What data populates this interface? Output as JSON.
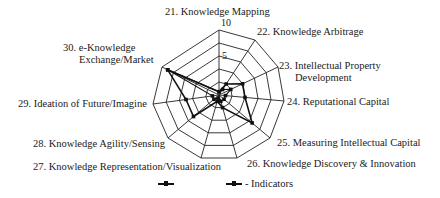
{
  "chart_data": {
    "type": "radar",
    "title": "",
    "axis_range": [
      0,
      10
    ],
    "tick_labels": [
      "5",
      "10"
    ],
    "grid_rings": [
      2,
      4,
      6,
      8,
      10
    ],
    "categories": [
      "21. Knowledge Mapping",
      "22. Knowledge Arbitrage",
      "23. Intellectual Property Development",
      "24. Reputational Capital",
      "25. Measuring Intellectual Capital",
      "26. Knowledge Discovery & Innovation",
      "27. Knowledge Representation/Visualization",
      "28. Knowledge Agility/Sensing",
      "29. Ideation of Future/Imagine",
      "30. e-Knowledge Exchange/Market"
    ],
    "series": [
      {
        "name": "Series 1",
        "values": [
          0.5,
          2,
          4,
          4,
          6.5,
          2,
          1,
          5,
          5,
          9
        ]
      },
      {
        "name": "Indicators",
        "values": [
          0.5,
          1,
          2,
          1,
          1,
          1,
          0.5,
          1,
          1,
          9
        ]
      }
    ],
    "legend": [
      "",
      "- Indicators"
    ],
    "legend_position": "bottom"
  },
  "labels": {
    "l21": "21. Knowledge Mapping",
    "l22": "22. Knowledge Arbitrage",
    "l23a": "23. Intellectual Property",
    "l23b": "Development",
    "l24": "24. Reputational Capital",
    "l25": "25. Measuring Intellectual Capital",
    "l26": "26. Knowledge Discovery & Innovation",
    "l27": "27. Knowledge Representation/Visualization",
    "l28": "28. Knowledge Agility/Sensing",
    "l29": "29. Ideation of Future/Imagine",
    "l30a": "30. e-Knowledge",
    "l30b": "Exchange/Market",
    "tick5": "5",
    "tick10": "10",
    "legend_text": "- Indicators"
  }
}
